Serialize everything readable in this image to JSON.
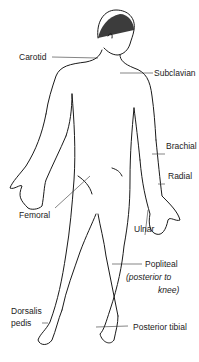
{
  "diagram": {
    "labels": [
      {
        "id": "carotid",
        "text": "Carotid"
      },
      {
        "id": "subclavian",
        "text": "Subclavian"
      },
      {
        "id": "brachial",
        "text": "Brachial"
      },
      {
        "id": "radial",
        "text": "Radial"
      },
      {
        "id": "femoral",
        "text": "Femoral"
      },
      {
        "id": "ulnar",
        "text": "Ulnar"
      },
      {
        "id": "popliteal",
        "text": "Popliteal"
      },
      {
        "id": "popliteal_note_1",
        "text": "(posterior to"
      },
      {
        "id": "popliteal_note_2",
        "text": "knee)"
      },
      {
        "id": "dorsalis_1",
        "text": "Dorsalis"
      },
      {
        "id": "dorsalis_2",
        "text": "pedis"
      },
      {
        "id": "posterior_tibial",
        "text": "Posterior tibial"
      }
    ],
    "colors": {
      "line": "#1a1a1a",
      "background": "#ffffff"
    }
  }
}
